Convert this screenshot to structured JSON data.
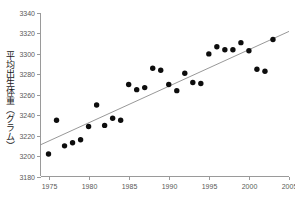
{
  "chart_data": {
    "type": "scatter",
    "title": "",
    "xlabel": "",
    "ylabel": "平均出生体重（グラム）",
    "xlim": [
      1974,
      2005
    ],
    "ylim": [
      3180,
      3340
    ],
    "grid": false,
    "legend": "none",
    "x_ticks": [
      "1975",
      "1980",
      "1985",
      "1990",
      "1995",
      "2000",
      "2005"
    ],
    "x_tick_values": [
      1975,
      1980,
      1985,
      1990,
      1995,
      2000,
      2005
    ],
    "y_ticks": [
      "3180",
      "3200",
      "3220",
      "3240",
      "3260",
      "3280",
      "3300",
      "3320",
      "3340"
    ],
    "y_tick_values": [
      3180,
      3200,
      3220,
      3240,
      3260,
      3280,
      3300,
      3320,
      3340
    ],
    "series": [
      {
        "name": "平均出生体重",
        "marker": "filled-circle",
        "color": "#0d0d0d",
        "x": [
          1975,
          1976,
          1977,
          1978,
          1979,
          1980,
          1981,
          1982,
          1983,
          1984,
          1985,
          1986,
          1987,
          1988,
          1989,
          1990,
          1991,
          1992,
          1993,
          1994,
          1995,
          1996,
          1997,
          1998,
          1999,
          2000,
          2001,
          2002,
          2003
        ],
        "values": [
          3202,
          3235,
          3210,
          3213,
          3216,
          3229,
          3250,
          3230,
          3237,
          3235,
          3270,
          3265,
          3267,
          3286,
          3284,
          3270,
          3264,
          3281,
          3272,
          3271,
          3300,
          3307,
          3304,
          3304,
          3311,
          3303,
          3285,
          3283,
          3314
        ]
      }
    ],
    "trend": {
      "name": "回帰直線",
      "color": "#8c8c8c",
      "x": [
        1974,
        2005
      ],
      "y": [
        3211,
        3322
      ]
    }
  }
}
